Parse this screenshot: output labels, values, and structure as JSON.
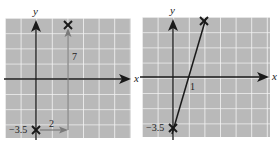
{
  "figure": {
    "panels": [
      {
        "id": "left",
        "description": "Plotting by slope: start at y-intercept, run 2, rise 7",
        "axis_labels": {
          "x": "x",
          "y": "y"
        },
        "points": [
          {
            "x": 0,
            "y": -3.5,
            "marker": "x"
          },
          {
            "x": 2,
            "y": 3.5,
            "marker": "x"
          }
        ],
        "annotations": {
          "intercept_label": "−3.5",
          "run_label": "2",
          "rise_label": "7"
        }
      },
      {
        "id": "right",
        "description": "Line through (0, -3.5) and (2, 3.5)",
        "axis_labels": {
          "x": "x",
          "y": "y"
        },
        "points": [
          {
            "x": 0,
            "y": -3.5,
            "marker": "x"
          },
          {
            "x": 2,
            "y": 3.5,
            "marker": "x"
          }
        ],
        "annotations": {
          "intercept_label": "−3.5",
          "x_intercept_label": "1"
        }
      }
    ],
    "colors": {
      "grid_fill": "#b8b8b8",
      "grid_line": "#f2f2f2",
      "ink": "#1a1a1a",
      "arrow_gray": "#7a7a7a"
    }
  }
}
